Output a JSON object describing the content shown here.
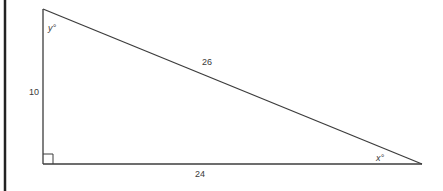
{
  "diagram": {
    "type": "right-triangle",
    "colors": {
      "stroke": "#3c3c3c",
      "border": "#222222",
      "text": "#3a3a3a",
      "background": "#ffffff"
    },
    "vertices": {
      "top_left": {
        "x": 43,
        "y": 9
      },
      "bottom_left": {
        "x": 43,
        "y": 164
      },
      "bottom_right": {
        "x": 422,
        "y": 164
      }
    },
    "sides": {
      "vertical_leg": "10",
      "horizontal_leg": "24",
      "hypotenuse": "26"
    },
    "angles": {
      "top_angle": "y°",
      "bottom_right_angle": "x°",
      "right_angle_marker": "right-angle"
    }
  }
}
